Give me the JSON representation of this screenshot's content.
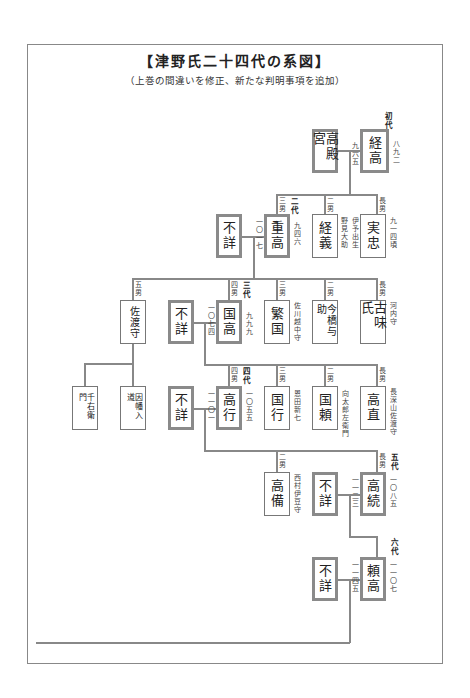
{
  "document": {
    "title": "【津野氏二十四代の系図】",
    "subtitle": "（上巻の間違いを修正、新たな判明事項を追加）"
  },
  "gen1": {
    "label": "初代",
    "spouse": "高殿宮",
    "head": {
      "name": "経高",
      "date": "八九二",
      "note": "九六五"
    }
  },
  "gen2": {
    "label": "二代",
    "spouse": "不詳",
    "main": {
      "name": "重高",
      "order": "三男",
      "date": "九四六",
      "note": "一〇一七"
    },
    "siblings": [
      {
        "name": "経義",
        "order": "二男",
        "note": "野見大助"
      },
      {
        "name": "実忠",
        "order": "長男",
        "note": "伊予出生",
        "date": "九一四頃"
      }
    ]
  },
  "gen3": {
    "label": "三代",
    "spouse": "不詳",
    "main": {
      "name": "国高",
      "order": "四男",
      "date": "九九九",
      "note": "一〇七四"
    },
    "siblings": [
      {
        "name": "佐渡守",
        "order": "五男"
      },
      {
        "name": "繁国",
        "order": "三男",
        "note": "佐川越中守"
      },
      {
        "name": "今橋与助",
        "order": "二男"
      },
      {
        "name": "古味氏",
        "order": "長男",
        "note": "河内守"
      }
    ]
  },
  "gen3_sado_children": [
    {
      "name": "千右衛門"
    },
    {
      "name": "因幡入道"
    }
  ],
  "gen4": {
    "label": "四代",
    "spouse": "不詳",
    "main": {
      "name": "高行",
      "order": "四男",
      "date": "一〇五五",
      "note": "一一〇一"
    },
    "siblings": [
      {
        "name": "国行",
        "order": "三男",
        "note": "恩田新七"
      },
      {
        "name": "国頼",
        "order": "二男",
        "note": "向太郎左衛門"
      },
      {
        "name": "高直",
        "order": "長男",
        "note": "長深山佐渡守"
      }
    ]
  },
  "gen5": {
    "label": "五代",
    "spouse": "不詳",
    "main": {
      "name": "高続",
      "order": "長男",
      "date": "一〇八五",
      "note": "一一二三"
    },
    "siblings": [
      {
        "name": "高備",
        "order": "二男",
        "note": "西村伊豆守"
      }
    ]
  },
  "gen6": {
    "label": "六代",
    "spouse": "不詳",
    "main": {
      "name": "頼高",
      "date": "一一〇七",
      "note": "一一四五"
    }
  },
  "colors": {
    "line": "#888888",
    "thick_border": "#8a8a8a",
    "text": "#222222"
  }
}
